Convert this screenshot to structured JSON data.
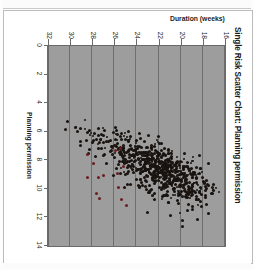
{
  "figure": {
    "title": "Single Risk Scatter Chart: Planning permission"
  },
  "chart_data": {
    "type": "scatter",
    "title": "Single Risk Scatter Chart: Planning permission",
    "xlabel": "Planning permission",
    "ylabel": "Duration (weeks)",
    "xlim": [
      0,
      14
    ],
    "ylim": [
      16,
      32
    ],
    "y_inverted": true,
    "xticks": [
      0,
      2,
      4,
      6,
      8,
      10,
      12,
      14
    ],
    "xtick_labels": [
      "0",
      "2",
      "4",
      "6",
      "8",
      "10",
      "12",
      "14"
    ],
    "yticks": [
      16,
      18,
      20,
      22,
      24,
      26,
      28,
      30,
      32
    ],
    "ytick_labels": [
      "16",
      "18",
      "20",
      "22",
      "24",
      "26",
      "28",
      "30",
      "32"
    ],
    "grid": "horizontal",
    "grid_color": "#6e6e6e",
    "plot_background": "#9d9d9d",
    "marker_color": "#1a1410",
    "highlight_color": "#6b1f22",
    "marker_size": 3,
    "n_points": 760,
    "legend": null,
    "annotations": [],
    "series": [
      {
        "name": "Simulation trials",
        "color": "#1a1410",
        "cluster_center": [
          8.6,
          21.6
        ],
        "x_spread": [
          5.8,
          11.9
        ],
        "y_spread": [
          18.0,
          30.2
        ]
      },
      {
        "name": "Highlighted trials",
        "color": "#6b1f22",
        "n_points": 14,
        "x_spread": [
          7.0,
          11.2
        ],
        "y_spread": [
          24.8,
          28.4
        ]
      }
    ]
  }
}
